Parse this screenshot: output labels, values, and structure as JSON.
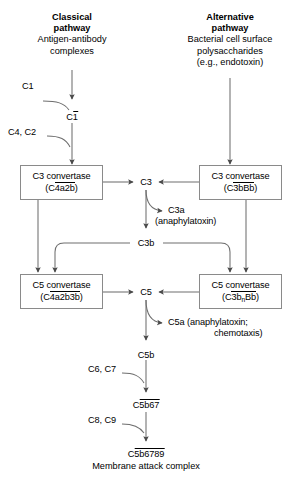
{
  "diagram": {
    "line_color": "#6e6e6e",
    "box_border_color": "#8a8a8a",
    "text_color": "#000000",
    "background": "#ffffff"
  },
  "headers": {
    "classical": {
      "title_line1": "Classical",
      "title_line2": "pathway",
      "desc_line1": "Antigen-antibody",
      "desc_line2": "complexes"
    },
    "alternative": {
      "title_line1": "Alternative",
      "title_line2": "pathway",
      "desc_line1": "Bacterial cell surface",
      "desc_line2": "polysaccharides",
      "desc_line3": "(e.g., endotoxin)"
    }
  },
  "nodes": {
    "c1_input": "C1",
    "c1_active_prefix": "C",
    "c1_active_bar": "1",
    "c4_c2_input": "C4, C2",
    "c3_convertase_classical": {
      "line1": "C3 convertase",
      "paren_open": "(C",
      "bar_text": "4a2b",
      "paren_close": ")"
    },
    "c3_convertase_alternative": {
      "line1": "C3 convertase",
      "paren_open": "(C",
      "bar_text": "3bBb",
      "paren_close": ")"
    },
    "c3": "C3",
    "c3a": "C3a",
    "c3a_note": "(anaphylatoxin)",
    "c3b": "C3b",
    "c5_convertase_classical": {
      "line1": "C5 convertase",
      "paren_open": "(C",
      "bar_text": "4a2b3b",
      "paren_close": ")"
    },
    "c5_convertase_alternative": {
      "line1": "C5 convertase",
      "paren_open": "(C",
      "bar_pre": "3b",
      "bar_sub": "n",
      "bar_post": "Bb",
      "paren_close": ")"
    },
    "c5": "C5",
    "c5a_line1": "C5a (anaphylatoxin;",
    "c5a_line2": "chemotaxis)",
    "c5b": "C5b",
    "c6_c7_input": "C6, C7",
    "c5b67_prefix": "C",
    "c5b67_bar": "5b67",
    "c8_c9_input": "C8, C9",
    "c5b6789_prefix": "C",
    "c5b6789_bar": "5b6789",
    "mac_label": "Membrane attack complex"
  }
}
